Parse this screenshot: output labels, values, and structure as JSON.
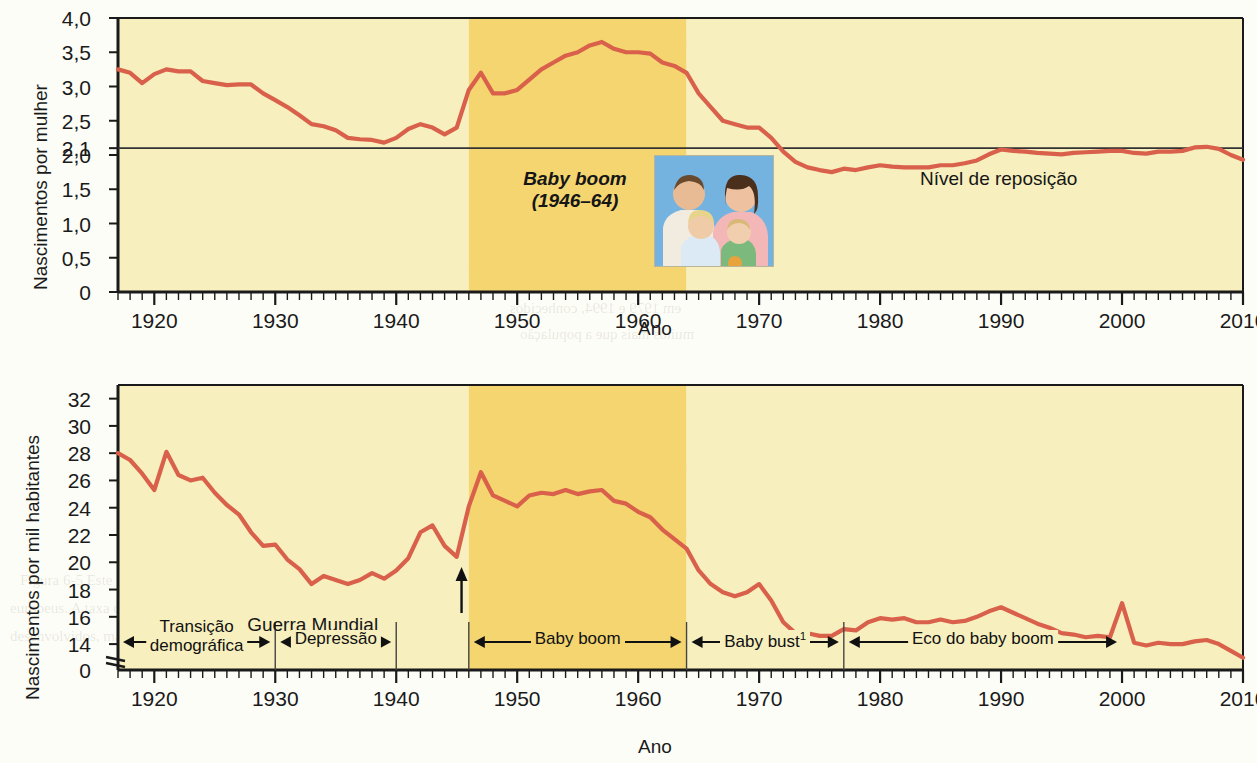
{
  "figure": {
    "accent_line_color": "#D9604A",
    "band_light_color": "#F7EFBE",
    "band_dark_color": "#F4D570",
    "plot_bg_color": "#FAF6D8",
    "axis_color": "#1a1a1a"
  },
  "charts": [
    {
      "id": "fertility",
      "ylabel": "Nascimentos por mulher",
      "xlabel": "Ano",
      "yticks": [
        "4,0",
        "3,5",
        "3,0",
        "2,5",
        "2,1",
        "2,0",
        "1,5",
        "1,0",
        "0,5",
        "0"
      ],
      "xticks": [
        "1920",
        "1930",
        "1940",
        "1950",
        "1960",
        "1970",
        "1980",
        "1990",
        "2000",
        "2010"
      ],
      "annotations": {
        "baby_boom_title": "Baby boom",
        "baby_boom_years": "(1946–64)",
        "replacement_level": "Nível de reposição"
      }
    },
    {
      "id": "birthrate",
      "ylabel": "Nascimentos por mil habitantes",
      "xlabel": "Ano",
      "yticks": [
        "32",
        "30",
        "28",
        "26",
        "24",
        "22",
        "20",
        "18",
        "16",
        "14",
        "0"
      ],
      "xticks": [
        "1920",
        "1930",
        "1940",
        "1950",
        "1960",
        "1970",
        "1980",
        "1990",
        "2000",
        "2010"
      ],
      "annotations": {
        "war_end": "Fim da II Guerra Mundial"
      },
      "phases": [
        {
          "label": "Transição demográfica",
          "start": 1917,
          "end": 1930
        },
        {
          "label": "Depressão",
          "start": 1930,
          "end": 1940
        },
        {
          "label": "Baby boom",
          "start": 1946,
          "end": 1964
        },
        {
          "label": "Baby bust¹",
          "start": 1964,
          "end": 1977
        },
        {
          "label": "Eco do baby boom",
          "start": 1977,
          "end": 2000
        }
      ]
    }
  ],
  "chart_data": [
    {
      "type": "line",
      "id": "fertility",
      "title": "",
      "xlabel": "Ano",
      "ylabel": "Nascimentos por mulher",
      "xlim": [
        1917,
        2010
      ],
      "ylim": [
        0,
        4.0
      ],
      "yticks": [
        0,
        0.5,
        1.0,
        1.5,
        2.0,
        2.1,
        2.5,
        3.0,
        3.5,
        4.0
      ],
      "xticks": [
        1920,
        1930,
        1940,
        1950,
        1960,
        1970,
        1980,
        1990,
        2000,
        2010
      ],
      "grid": false,
      "legend": null,
      "reference_line": {
        "y": 2.1,
        "label": "Nível de reposição"
      },
      "shaded_bands": [
        {
          "from": 1917,
          "to": 1946,
          "color": "#F7EFBE",
          "label": ""
        },
        {
          "from": 1946,
          "to": 1964,
          "color": "#F4D570",
          "label": "Baby boom (1946–64)"
        },
        {
          "from": 1964,
          "to": 2010,
          "color": "#F7EFBE",
          "label": ""
        }
      ],
      "x": [
        1917,
        1918,
        1919,
        1920,
        1921,
        1922,
        1923,
        1924,
        1925,
        1926,
        1927,
        1928,
        1929,
        1930,
        1931,
        1932,
        1933,
        1934,
        1935,
        1936,
        1937,
        1938,
        1939,
        1940,
        1941,
        1942,
        1943,
        1944,
        1945,
        1946,
        1947,
        1948,
        1949,
        1950,
        1951,
        1952,
        1953,
        1954,
        1955,
        1956,
        1957,
        1958,
        1959,
        1960,
        1961,
        1962,
        1963,
        1964,
        1965,
        1966,
        1967,
        1968,
        1969,
        1970,
        1971,
        1972,
        1973,
        1974,
        1975,
        1976,
        1977,
        1978,
        1979,
        1980,
        1981,
        1982,
        1983,
        1984,
        1985,
        1986,
        1987,
        1988,
        1989,
        1990,
        1991,
        1992,
        1993,
        1994,
        1995,
        1996,
        1997,
        1998,
        1999,
        2000,
        2001,
        2002,
        2003,
        2004,
        2005,
        2006,
        2007,
        2008,
        2009,
        2010
      ],
      "y": [
        3.25,
        3.2,
        3.05,
        3.18,
        3.25,
        3.22,
        3.22,
        3.08,
        3.05,
        3.02,
        3.03,
        3.03,
        2.9,
        2.8,
        2.7,
        2.58,
        2.45,
        2.42,
        2.36,
        2.25,
        2.23,
        2.22,
        2.18,
        2.25,
        2.38,
        2.45,
        2.4,
        2.3,
        2.4,
        2.95,
        3.2,
        2.9,
        2.9,
        2.95,
        3.1,
        3.25,
        3.35,
        3.45,
        3.5,
        3.6,
        3.65,
        3.55,
        3.5,
        3.5,
        3.48,
        3.35,
        3.3,
        3.2,
        2.9,
        2.7,
        2.5,
        2.45,
        2.4,
        2.4,
        2.25,
        2.05,
        1.9,
        1.82,
        1.78,
        1.75,
        1.8,
        1.78,
        1.82,
        1.85,
        1.83,
        1.82,
        1.82,
        1.82,
        1.85,
        1.85,
        1.88,
        1.92,
        2.01,
        2.08,
        2.06,
        2.05,
        2.03,
        2.02,
        2.01,
        2.03,
        2.04,
        2.05,
        2.06,
        2.06,
        2.03,
        2.02,
        2.05,
        2.05,
        2.06,
        2.11,
        2.12,
        2.09,
        2.0,
        1.93
      ]
    },
    {
      "type": "line",
      "id": "birthrate",
      "title": "",
      "xlabel": "Ano",
      "ylabel": "Nascimentos por mil habitantes",
      "xlim": [
        1917,
        2010
      ],
      "ylim": [
        13,
        33
      ],
      "yticks": [
        14,
        16,
        18,
        20,
        22,
        24,
        26,
        28,
        30,
        32
      ],
      "xticks": [
        1920,
        1930,
        1940,
        1950,
        1960,
        1970,
        1980,
        1990,
        2000,
        2010
      ],
      "grid": false,
      "axis_break": true,
      "legend": null,
      "annotation_arrow": {
        "x": 1945,
        "label": "Fim da II Guerra Mundial"
      },
      "shaded_bands": [
        {
          "from": 1917,
          "to": 1946,
          "color": "#F7EFBE",
          "label": ""
        },
        {
          "from": 1946,
          "to": 1964,
          "color": "#F4D570",
          "label": "Baby boom"
        },
        {
          "from": 1964,
          "to": 2010,
          "color": "#F7EFBE",
          "label": ""
        }
      ],
      "x": [
        1917,
        1918,
        1919,
        1920,
        1921,
        1922,
        1923,
        1924,
        1925,
        1926,
        1927,
        1928,
        1929,
        1930,
        1931,
        1932,
        1933,
        1934,
        1935,
        1936,
        1937,
        1938,
        1939,
        1940,
        1941,
        1942,
        1943,
        1944,
        1945,
        1946,
        1947,
        1948,
        1949,
        1950,
        1951,
        1952,
        1953,
        1954,
        1955,
        1956,
        1957,
        1958,
        1959,
        1960,
        1961,
        1962,
        1963,
        1964,
        1965,
        1966,
        1967,
        1968,
        1969,
        1970,
        1971,
        1972,
        1973,
        1974,
        1975,
        1976,
        1977,
        1978,
        1979,
        1980,
        1981,
        1982,
        1983,
        1984,
        1985,
        1986,
        1987,
        1988,
        1989,
        1990,
        1991,
        1992,
        1993,
        1994,
        1995,
        1996,
        1997,
        1998,
        1999,
        2000,
        2001,
        2002,
        2003,
        2004,
        2005,
        2006,
        2007,
        2008,
        2009,
        2010
      ],
      "y": [
        28.0,
        27.5,
        26.5,
        25.3,
        28.1,
        26.4,
        26.0,
        26.2,
        25.1,
        24.2,
        23.5,
        22.2,
        21.2,
        21.3,
        20.2,
        19.5,
        18.4,
        19.0,
        18.7,
        18.4,
        18.7,
        19.2,
        18.8,
        19.4,
        20.3,
        22.2,
        22.7,
        21.2,
        20.4,
        24.1,
        26.6,
        24.9,
        24.5,
        24.1,
        24.9,
        25.1,
        25.0,
        25.3,
        25.0,
        25.2,
        25.3,
        24.5,
        24.3,
        23.7,
        23.3,
        22.4,
        21.7,
        21.0,
        19.4,
        18.4,
        17.8,
        17.5,
        17.8,
        18.4,
        17.2,
        15.6,
        14.8,
        14.8,
        14.6,
        14.6,
        15.1,
        15.0,
        15.6,
        15.9,
        15.8,
        15.9,
        15.6,
        15.6,
        15.8,
        15.6,
        15.7,
        16.0,
        16.4,
        16.7,
        16.3,
        15.9,
        15.5,
        15.2,
        14.8,
        14.7,
        14.5,
        14.6,
        14.5,
        17.0,
        14.1,
        13.9,
        14.1,
        14.0,
        14.0,
        14.2,
        14.3,
        14.0,
        13.5,
        13.0
      ]
    }
  ],
  "bleed_text": {
    "top_heading_1": "Crescimento populacional e taxas",
    "top_heading_2": "fertilidade na China",
    "lines": [
      "na reduzir a população e resolver a difícil",
      "nto e a produtividade do país, ele deci",
      "a de um filho.' Algumas informações confi",
      "uma política de controle da populaçã",
      "bertos, funcionários do governo discutiram a alt",
      "a fome em massa. Instituiu-se que a políti",
      "ia reduziria a formidável taxa de crescimento",
      "em 1979 e 1994, conhecidos",
      "muitos mais que a população"
    ],
    "right_col": [
      "Imagem eco-",
      "do desenvolvid",
      "Mundo",
      "Eco do"
    ],
    "bottom_lines": [
      "1930             1940             1950             1960             1970             1980",
      "Ano",
      "Figura 6-5 Este gráfico acompanha a taxa e o",
      "europeus. A taxa de crescimento ficou muito",
      "desenvolvidos, mantiveram suas taxas de crescimento",
      "das escolas nos EUA e nas taxas de empr",
      "o-se. O casal levou 1,94 anos a mais somente",
      "teu, 1900 as crianças de pouco as 52 que a so"
    ]
  }
}
